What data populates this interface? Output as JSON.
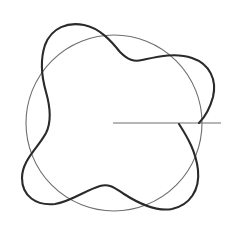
{
  "diagram": {
    "type": "polar-wave-figure",
    "colors": {
      "background": "#ffffff",
      "circle": "#6e6e6e",
      "wave_curve": "#2a2a2a",
      "radius_line": "#6e6e6e"
    },
    "circle": {
      "cx": 114,
      "cy": 123,
      "r": 88
    },
    "radius_line": {
      "x1": 113,
      "y1": 123,
      "x2": 221,
      "y2": 123
    },
    "wave_curve": {
      "description": "closed wavy curve oscillating around the base circle with 4 lobes",
      "lobes": 4
    }
  }
}
